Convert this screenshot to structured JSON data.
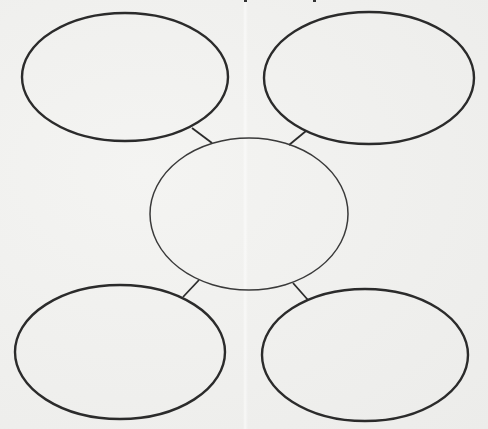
{
  "diagram": {
    "type": "bubble-map",
    "stroke_color": "#2b2b2b",
    "center_stroke_color": "#3a3a3a",
    "background_color": "#f1f1ef",
    "nodes": [
      {
        "id": "top-left",
        "cx": 125,
        "cy": 77,
        "rx": 103,
        "ry": 64,
        "stroke_width": 2.4,
        "label": ""
      },
      {
        "id": "top-right",
        "cx": 369,
        "cy": 78,
        "rx": 105,
        "ry": 66,
        "stroke_width": 2.4,
        "label": ""
      },
      {
        "id": "center",
        "cx": 249,
        "cy": 214,
        "rx": 99,
        "ry": 76,
        "stroke_width": 1.5,
        "label": ""
      },
      {
        "id": "bottom-left",
        "cx": 120,
        "cy": 352,
        "rx": 105,
        "ry": 67,
        "stroke_width": 2.4,
        "label": ""
      },
      {
        "id": "bottom-right",
        "cx": 365,
        "cy": 355,
        "rx": 103,
        "ry": 66,
        "stroke_width": 2.4,
        "label": ""
      }
    ],
    "connectors": [
      {
        "id": "center-to-top-left",
        "x1": 192,
        "y1": 128,
        "x2": 212,
        "y2": 143
      },
      {
        "id": "center-to-top-right",
        "x1": 306,
        "y1": 131,
        "x2": 289,
        "y2": 145
      },
      {
        "id": "center-to-bottom-left",
        "x1": 199,
        "y1": 280,
        "x2": 183,
        "y2": 297
      },
      {
        "id": "center-to-bottom-right",
        "x1": 293,
        "y1": 283,
        "x2": 308,
        "y2": 300
      }
    ]
  }
}
